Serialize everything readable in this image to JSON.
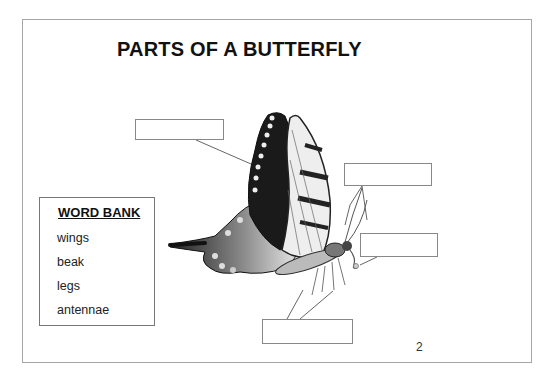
{
  "slide": {
    "title": "PARTS OF A BUTTERFLY",
    "page_number": "2"
  },
  "word_bank": {
    "heading": "WORD BANK",
    "items": [
      "wings",
      "beak",
      "legs",
      "antennae"
    ]
  },
  "label_boxes": [
    {
      "id": "wings-label",
      "value": ""
    },
    {
      "id": "antennae-label",
      "value": ""
    },
    {
      "id": "beak-label",
      "value": ""
    },
    {
      "id": "legs-label",
      "value": ""
    }
  ],
  "image": {
    "subject": "butterfly-illustration",
    "style": "grayscale swallowtail side view"
  }
}
